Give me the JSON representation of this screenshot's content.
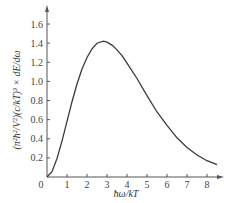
{
  "chart_data": {
    "type": "line",
    "title": "",
    "xlabel": "ħω/kT",
    "ylabel": "(π²ħ²/V²)(c/kT)³ × dE/dω",
    "xlim": [
      0,
      8.8
    ],
    "ylim": [
      0,
      1.7
    ],
    "xticks": [
      "0",
      "1",
      "2",
      "3",
      "4",
      "5",
      "6",
      "7",
      "8"
    ],
    "yticks": [
      "0.2",
      "0.4",
      "0.6",
      "0.8",
      "1.0",
      "1.2",
      "1.4",
      "1.6"
    ],
    "grid": false,
    "legend": null,
    "series": [
      {
        "name": "Planck spectrum",
        "x": [
          0,
          0.25,
          0.5,
          0.75,
          1,
          1.25,
          1.5,
          1.75,
          2,
          2.25,
          2.5,
          2.82,
          3,
          3.25,
          3.5,
          3.75,
          4,
          4.5,
          5,
          5.5,
          6,
          6.5,
          7,
          7.5,
          8,
          8.5
        ],
        "values": [
          0,
          0.055,
          0.193,
          0.376,
          0.582,
          0.788,
          0.973,
          1.13,
          1.25,
          1.34,
          1.4,
          1.42,
          1.41,
          1.38,
          1.33,
          1.27,
          1.19,
          1.03,
          0.85,
          0.68,
          0.54,
          0.41,
          0.31,
          0.23,
          0.17,
          0.13
        ]
      }
    ],
    "peak": {
      "x": 2.82,
      "y": 1.42
    }
  },
  "axes": {
    "origin_label": "0",
    "x_title": "ħω/kT"
  },
  "colors": {
    "line": "#3a3a3a",
    "axis": "#555555",
    "text": "#444444"
  }
}
